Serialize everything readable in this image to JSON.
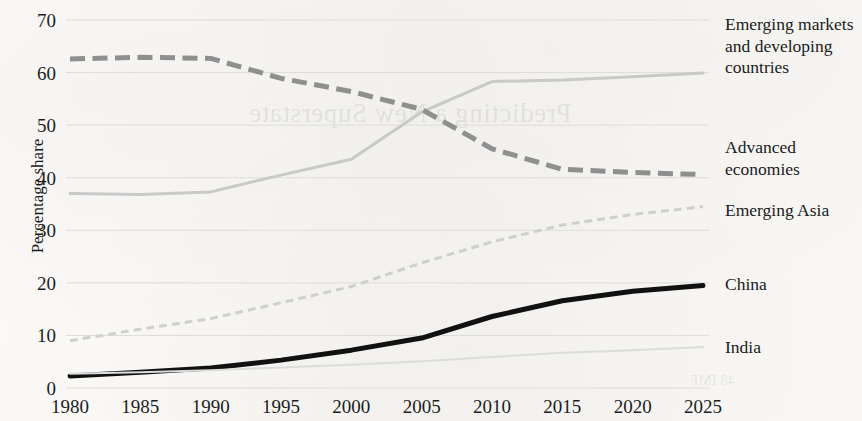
{
  "axes": {
    "ylabel": "Percentage share",
    "yticks": [
      0,
      10,
      20,
      30,
      40,
      50,
      60,
      70
    ],
    "xticks": [
      "1980",
      "1985",
      "1990",
      "1995",
      "2000",
      "2005",
      "2010",
      "2015",
      "2020",
      "2025"
    ]
  },
  "legend": {
    "emdc": "Emerging markets and developing countries",
    "advanced": "Advanced economies",
    "emerging_asia": "Emerging Asia",
    "china": "China",
    "india": "India"
  },
  "showthrough": {
    "line1": "Predicting a New Superstate",
    "line2": "48 IMF"
  },
  "colors": {
    "emdc": "#c9c9c9",
    "advanced": "#8f8f8f",
    "emerging_asia": "#cfcfcf",
    "china": "#111111",
    "india": "#dcdcdc",
    "grid": "#dedcd8",
    "text": "#1b1b1b"
  },
  "chart_data": {
    "type": "line",
    "title": "",
    "xlabel": "",
    "ylabel": "Percentage share",
    "x": [
      1980,
      1985,
      1990,
      1995,
      2000,
      2005,
      2010,
      2015,
      2020,
      2025
    ],
    "xlim": [
      1980,
      2025
    ],
    "ylim": [
      0,
      70
    ],
    "ytick_step": 10,
    "grid": true,
    "legend_position": "right",
    "series": [
      {
        "name": "Emerging markets and developing countries",
        "style": "solid",
        "width": "medium",
        "color": "#c9c9c9",
        "values": [
          37.0,
          36.8,
          37.3,
          40.5,
          43.5,
          52.5,
          58.3,
          58.6,
          59.2,
          59.9
        ]
      },
      {
        "name": "Advanced economies",
        "style": "dashed",
        "width": "thick",
        "color": "#8f8f8f",
        "values": [
          62.6,
          62.9,
          62.7,
          58.9,
          56.4,
          53.0,
          45.5,
          41.6,
          41.0,
          40.6
        ]
      },
      {
        "name": "Emerging Asia",
        "style": "short-dashed",
        "width": "medium",
        "color": "#cfcfcf",
        "values": [
          9.0,
          11.2,
          13.2,
          16.2,
          19.3,
          23.8,
          27.8,
          31.0,
          33.0,
          34.5
        ]
      },
      {
        "name": "China",
        "style": "solid",
        "width": "thick",
        "color": "#111111",
        "values": [
          2.3,
          3.0,
          3.8,
          5.3,
          7.2,
          9.5,
          13.6,
          16.6,
          18.4,
          19.5
        ]
      },
      {
        "name": "India",
        "style": "solid",
        "width": "thin",
        "color": "#dcdcdc",
        "values": [
          2.7,
          3.0,
          3.4,
          3.9,
          4.4,
          5.1,
          5.9,
          6.7,
          7.2,
          7.8
        ]
      }
    ]
  }
}
